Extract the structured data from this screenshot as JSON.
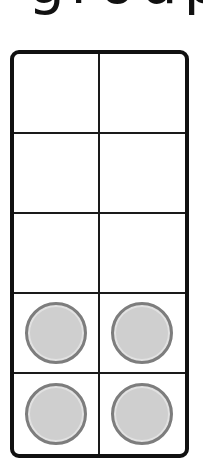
{
  "heading": {
    "text": "group"
  },
  "ten_frame": {
    "rows": 5,
    "columns": 2,
    "frame_color": "#111111",
    "counter_fill": "#cfcfcf",
    "counter_border": "#7d7d7d",
    "cells": [
      {
        "row": 0,
        "col": 0,
        "filled": false
      },
      {
        "row": 0,
        "col": 1,
        "filled": false
      },
      {
        "row": 1,
        "col": 0,
        "filled": false
      },
      {
        "row": 1,
        "col": 1,
        "filled": false
      },
      {
        "row": 2,
        "col": 0,
        "filled": false
      },
      {
        "row": 2,
        "col": 1,
        "filled": false
      },
      {
        "row": 3,
        "col": 0,
        "filled": true
      },
      {
        "row": 3,
        "col": 1,
        "filled": true
      },
      {
        "row": 4,
        "col": 0,
        "filled": true
      },
      {
        "row": 4,
        "col": 1,
        "filled": true
      }
    ],
    "filled_count": 4
  }
}
